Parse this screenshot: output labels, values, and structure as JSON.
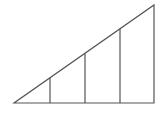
{
  "diagram": {
    "type": "right-triangle-with-vertical-segments",
    "stroke_color": "#555555",
    "background": "#ffffff",
    "triangle": {
      "left_corner": [
        14,
        103
      ],
      "right_corner": [
        154,
        103
      ],
      "apex": [
        154,
        5
      ]
    },
    "verticals": [
      {
        "x": 50,
        "top": 78
      },
      {
        "x": 85,
        "top": 54
      },
      {
        "x": 120,
        "top": 29
      }
    ]
  }
}
